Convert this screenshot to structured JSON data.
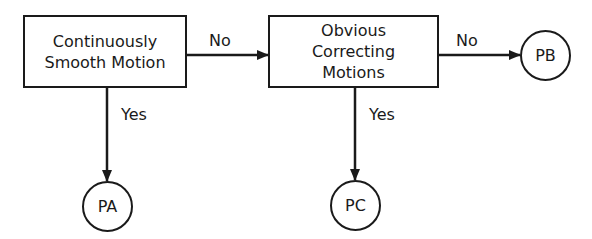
{
  "diagram": {
    "type": "flowchart",
    "nodes": {
      "decision1": {
        "lines": [
          "Continuously",
          "Smooth Motion"
        ]
      },
      "decision2": {
        "lines": [
          "Obvious",
          "Correcting",
          "Motions"
        ]
      },
      "pa": {
        "label": "PA"
      },
      "pb": {
        "label": "PB"
      },
      "pc": {
        "label": "PC"
      }
    },
    "edges": {
      "d1_to_d2": {
        "label": "No"
      },
      "d1_to_pa": {
        "label": "Yes"
      },
      "d2_to_pb": {
        "label": "No"
      },
      "d2_to_pc": {
        "label": "Yes"
      }
    },
    "colors": {
      "stroke": "#1a1a1a",
      "background": "#ffffff"
    }
  }
}
